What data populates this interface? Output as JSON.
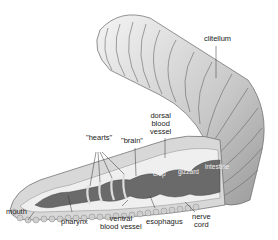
{
  "diagram": {
    "labels": {
      "clitellum": "clitellum",
      "dorsal_blood_vessel_1": "dorsal",
      "dorsal_blood_vessel_2": "blood",
      "dorsal_blood_vessel_3": "vessel",
      "hearts": "\"hearts\"",
      "brain": "\"brain\"",
      "crop": "crop",
      "gizzard": "gizzard",
      "intestine": "intestine",
      "mouth": "mouth",
      "pharynx": "pharynx",
      "ventral_blood_vessel_1": "ventral",
      "ventral_blood_vessel_2": "blood vessel",
      "esophagus": "esophagus",
      "nerve_cord_1": "nerve",
      "nerve_cord_2": "cord"
    },
    "colors": {
      "body_light": "#e6e6e6",
      "body_mid": "#bdbdbd",
      "body_dark": "#8a8a8a",
      "gut": "#6a6a6a",
      "outline": "#555555"
    }
  }
}
